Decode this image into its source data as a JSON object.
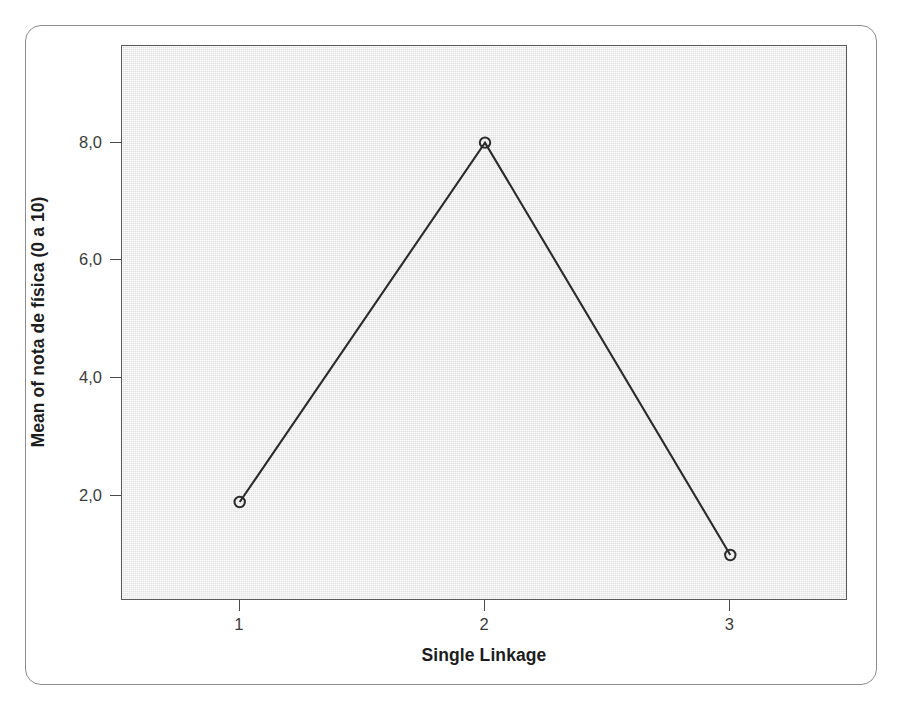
{
  "chart_data": {
    "type": "line",
    "title": "",
    "subtitle": "",
    "xlabel": "Single Linkage",
    "ylabel": "Mean of nota de física (0 a 10)",
    "categories": [
      "1",
      "2",
      "3"
    ],
    "x": [
      1,
      2,
      3
    ],
    "values": [
      1.9,
      8.0,
      1.0
    ],
    "series": [
      {
        "name": "Mean of nota de física (0 a 10)",
        "values": [
          1.9,
          8.0,
          1.0
        ]
      }
    ],
    "xtick_labels": [
      "1",
      "2",
      "3"
    ],
    "ytick_labels": [
      "2,0",
      "4,0",
      "6,0",
      "8,0"
    ],
    "ytick_values": [
      2.0,
      4.0,
      6.0,
      8.0
    ],
    "ylim": [
      0.22,
      9.64
    ],
    "xlim": [
      0.52,
      3.48
    ],
    "grid": false,
    "legend": null,
    "legend_position": "none",
    "marker": "open-circle",
    "line_color": "#2b2b2b",
    "marker_color": "#2b2b2b",
    "plot_background_color": "#ececec",
    "decimal_separator": ",",
    "annotations": []
  },
  "figure": {
    "frame_border_color": "#8d8d8d",
    "page_background_color": "#ffffff",
    "ghost_text": [
      "",
      "",
      ""
    ]
  }
}
